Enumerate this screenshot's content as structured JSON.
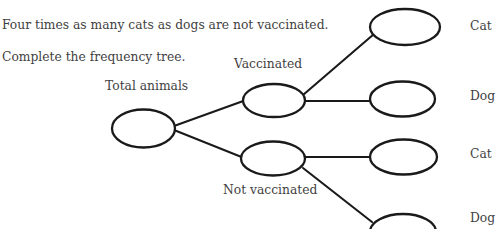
{
  "question": {
    "line1": "Four times as many cats as dogs are not vaccinated.",
    "line2": "Complete the frequency tree."
  },
  "tree": {
    "root": {
      "label": "Total animals",
      "value": ""
    },
    "branches": [
      {
        "label": "Vaccinated",
        "value": "",
        "leaves": [
          {
            "label": "Cat",
            "value": ""
          },
          {
            "label": "Dog",
            "value": ""
          }
        ]
      },
      {
        "label": "Not vaccinated",
        "value": "",
        "leaves": [
          {
            "label": "Cat",
            "value": ""
          },
          {
            "label": "Dog",
            "value": ""
          }
        ]
      }
    ]
  },
  "colors": {
    "stroke": "#1a1a1a",
    "text": "#3f3f3f",
    "background": "#ffffff"
  }
}
